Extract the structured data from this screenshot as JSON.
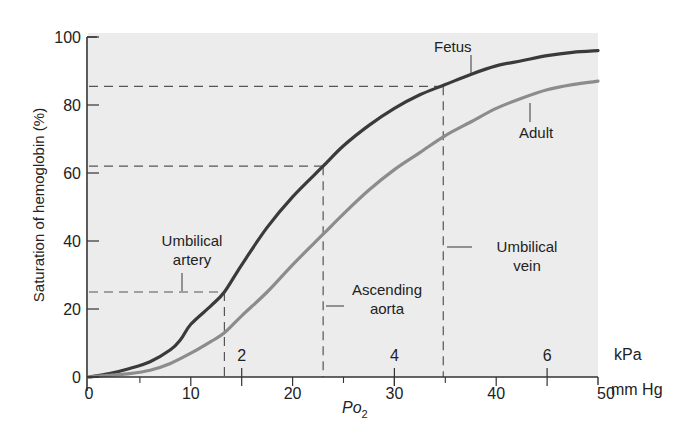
{
  "chart_data": {
    "type": "line",
    "title": "",
    "xlabel": "Po2",
    "xlabel_main": "Po",
    "xlabel_sub": "2",
    "x_unit_primary": "mm Hg",
    "x_unit_secondary": "kPa",
    "ylabel": "Saturation of hemoglobin (%)",
    "xlim": [
      0,
      50
    ],
    "ylim": [
      0,
      100
    ],
    "x_ticks": [
      0,
      10,
      20,
      30,
      40,
      50
    ],
    "x_tick_labels": [
      "0",
      "10",
      "20",
      "30",
      "40",
      "50"
    ],
    "kpa_ticks": [
      2,
      4,
      6
    ],
    "kpa_tick_labels": [
      "2",
      "4",
      "6"
    ],
    "y_ticks": [
      0,
      20,
      40,
      60,
      80,
      100
    ],
    "y_tick_labels": [
      "0",
      "20",
      "40",
      "60",
      "80",
      "100"
    ],
    "grid": false,
    "series": [
      {
        "name": "Fetus",
        "color": "#3a3a3a",
        "x": [
          0,
          2,
          4,
          6,
          8,
          9,
          10,
          12,
          13.3,
          15,
          17.5,
          20,
          23,
          25,
          27.5,
          30,
          32.5,
          35,
          37.5,
          40,
          42.5,
          45,
          47.5,
          50
        ],
        "y": [
          0,
          1,
          2.5,
          4.5,
          8,
          11,
          15.5,
          21,
          25,
          33,
          44,
          53,
          62,
          68,
          74,
          79,
          83,
          86,
          89,
          91.5,
          93,
          94.5,
          95.5,
          96
        ]
      },
      {
        "name": "Adult",
        "color": "#8c8c8c",
        "x": [
          0,
          2,
          4,
          6,
          8,
          10,
          12,
          13.3,
          15,
          17.5,
          20,
          23,
          25,
          27.5,
          30,
          32.5,
          35,
          37.5,
          40,
          42.5,
          45,
          47.5,
          50
        ],
        "y": [
          0,
          0.5,
          1,
          2,
          4,
          7,
          10.5,
          13,
          18,
          25,
          33,
          42,
          48,
          55,
          61,
          66,
          71,
          75,
          79,
          82,
          84.5,
          86,
          87
        ]
      }
    ],
    "annotations": [
      {
        "label": "Umbilical artery",
        "line1": "Umbilical",
        "line2": "artery",
        "po2": 13.3,
        "saturation": 25
      },
      {
        "label": "Ascending aorta",
        "line1": "Ascending",
        "line2": "aorta",
        "po2": 23,
        "saturation": 62
      },
      {
        "label": "Umbilical vein",
        "line1": "Umbilical",
        "line2": "vein",
        "po2": 34.8,
        "saturation": 85.5
      }
    ],
    "legend": {
      "position": "inline-labels",
      "entries": [
        "Fetus",
        "Adult"
      ]
    }
  },
  "colors": {
    "plot_bg": "#ececec",
    "axis": "#333333",
    "fetus": "#3a3a3a",
    "adult": "#8c8c8c",
    "dash": "#555555"
  }
}
